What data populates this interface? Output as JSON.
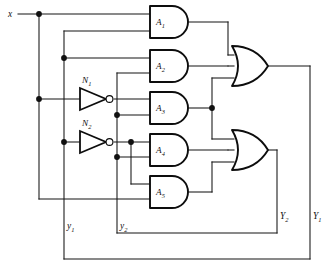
{
  "diagram": {
    "type": "logic-circuit-schematic",
    "colors": {
      "wire": "#141414",
      "gate_outline": "#0d0d0d",
      "background": "#ffffff",
      "junction": "#101010"
    }
  },
  "inputs": [
    {
      "id": "x",
      "label": "x",
      "sub": ""
    }
  ],
  "outputs": [
    {
      "id": "Y1",
      "label": "Y",
      "sub": "1"
    },
    {
      "id": "Y2",
      "label": "Y",
      "sub": "2"
    }
  ],
  "state_feedback": [
    {
      "id": "y1",
      "label": "y",
      "sub": "1"
    },
    {
      "id": "y2",
      "label": "y",
      "sub": "2"
    }
  ],
  "and_gates": [
    {
      "id": "A1",
      "label": "A",
      "sub": "1"
    },
    {
      "id": "A2",
      "label": "A",
      "sub": "2"
    },
    {
      "id": "A3",
      "label": "A",
      "sub": "3"
    },
    {
      "id": "A4",
      "label": "A",
      "sub": "4"
    },
    {
      "id": "A5",
      "label": "A",
      "sub": "5"
    }
  ],
  "inverters": [
    {
      "id": "N1",
      "label": "N",
      "sub": "1"
    },
    {
      "id": "N2",
      "label": "N",
      "sub": "2"
    }
  ],
  "or_gates": [
    {
      "id": "OR1",
      "label": "",
      "sub": "",
      "drives": "Y1"
    },
    {
      "id": "OR2",
      "label": "",
      "sub": "",
      "drives": "Y2"
    }
  ]
}
